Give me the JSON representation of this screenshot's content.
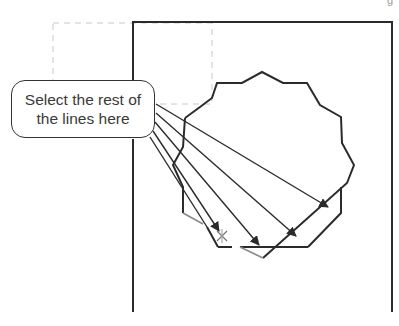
{
  "corner_label": "g",
  "callout": {
    "line1": "Select the rest of",
    "line2": "the lines here"
  },
  "colors": {
    "stroke": "#2b2b2b",
    "highlight_stroke": "#8a8a8a",
    "dashed": "#c8c8c8"
  },
  "drawing": {
    "frame": "M133,104 L133,22 L392,22 L392,312",
    "frame_left": "M133,139 L133,312",
    "dashed_rect": {
      "x": 53,
      "y": 23,
      "w": 159,
      "h": 81
    },
    "polygon_a": "M185,118 L200,107 L212,98 L217,83 L242,83 L262,72 L283,83 L307,83 L320,105 L341,117 L342,143 L354,165 L347,183 L263,258",
    "polygon_a_left": "M185,118 L183,147 L173,165 L183,187 L183,213",
    "polygon_b": "M308,247 L341,213 L341,187 M308,247 L240,247",
    "polygon_b_bottom_left": "M218,247 L207,227",
    "gray_segments": [
      "M183,213 L203,224",
      "M240,247 L263,258"
    ],
    "leaders": [
      {
        "x1": 156,
        "y1": 104,
        "x2": 328,
        "y2": 207
      },
      {
        "x1": 156,
        "y1": 113,
        "x2": 296,
        "y2": 236
      },
      {
        "x1": 155,
        "y1": 122,
        "x2": 259,
        "y2": 245
      },
      {
        "x1": 153,
        "y1": 131,
        "x2": 219,
        "y2": 231
      },
      {
        "x1": 150,
        "y1": 137,
        "x2": 207,
        "y2": 227
      }
    ],
    "cursor": {
      "x": 222,
      "y": 236,
      "symbol": "×"
    }
  }
}
